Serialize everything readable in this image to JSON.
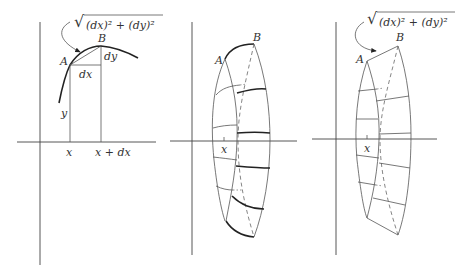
{
  "panels": [
    {
      "id": "graph-arc-length",
      "labels": {
        "formula_root": "√",
        "formula": "(dx)² + (dy)²",
        "point_a": "A",
        "point_b": "B",
        "dx": "dx",
        "dy": "dy",
        "y": "y",
        "x": "x",
        "x_plus_dx": "x + dx"
      }
    },
    {
      "id": "surface-of-revolution-curved",
      "labels": {
        "point_a": "A",
        "point_b": "B",
        "x": "x"
      }
    },
    {
      "id": "surface-of-revolution-frustum",
      "labels": {
        "formula_root": "√",
        "formula": "(dx)² + (dy)²",
        "point_a": "A",
        "point_b": "B",
        "x": "x"
      }
    }
  ]
}
